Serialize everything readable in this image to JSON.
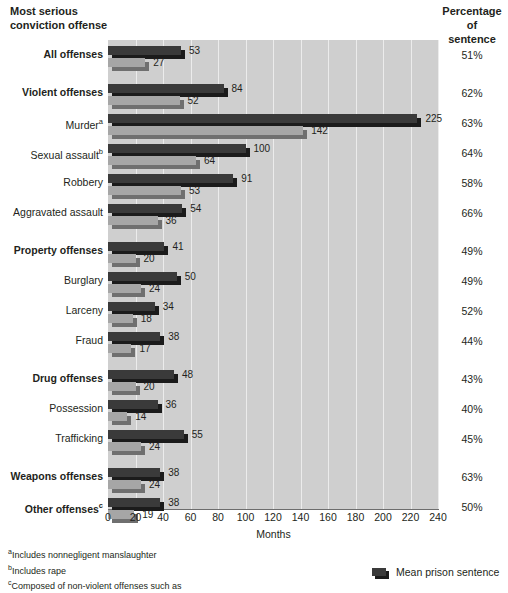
{
  "headers": {
    "left": "Most serious\nconviction offense",
    "right": "Percentage\nof\nsentence"
  },
  "axis": {
    "title": "Months",
    "ticks": [
      "0",
      "20",
      "40",
      "60",
      "80",
      "100",
      "120",
      "140",
      "160",
      "180",
      "200",
      "220",
      "240"
    ]
  },
  "footnotes": [
    {
      "marker": "a",
      "text": "Includes nonnegligent manslaughter"
    },
    {
      "marker": "b",
      "text": "Includes rape"
    },
    {
      "marker": "c",
      "text": "Composed of non-violent offenses such as"
    }
  ],
  "legend": {
    "items": [
      {
        "label": "Mean prison sentence",
        "color": "#3a3a3a"
      }
    ]
  },
  "chart_data": {
    "type": "bar",
    "orientation": "horizontal",
    "title": "",
    "xlabel": "Months",
    "ylabel": "Most serious conviction offense",
    "xlim": [
      0,
      240
    ],
    "xticks": [
      0,
      20,
      40,
      60,
      80,
      100,
      120,
      140,
      160,
      180,
      200,
      220,
      240
    ],
    "grid": true,
    "legend_position": "bottom-right",
    "categories": [
      "All offenses",
      "Violent offenses",
      "Murder",
      "Sexual assault",
      "Robbery",
      "Aggravated assault",
      "Property offenses",
      "Burglary",
      "Larceny",
      "Fraud",
      "Drug offenses",
      "Possession",
      "Trafficking",
      "Weapons offenses",
      "Other offenses"
    ],
    "series": [
      {
        "name": "Mean prison sentence",
        "color": "#3a3a3a",
        "values": [
          53,
          84,
          225,
          100,
          91,
          54,
          41,
          50,
          34,
          38,
          48,
          36,
          55,
          38,
          38
        ]
      },
      {
        "name": "Mean time served",
        "color": "#a6a6a6",
        "values": [
          27,
          52,
          142,
          64,
          53,
          36,
          20,
          24,
          18,
          17,
          20,
          14,
          24,
          24,
          19
        ]
      }
    ],
    "percentage_of_sentence": [
      "51%",
      "62%",
      "63%",
      "64%",
      "58%",
      "66%",
      "49%",
      "49%",
      "52%",
      "44%",
      "43%",
      "40%",
      "45%",
      "63%",
      "50%"
    ]
  },
  "rows": [
    {
      "label": "All offenses",
      "footnote": "",
      "bold": true,
      "sentence": 53,
      "served": 27,
      "pct": "51%",
      "gap_before": 0
    },
    {
      "label": "Violent offenses",
      "footnote": "",
      "bold": true,
      "sentence": 84,
      "served": 52,
      "pct": "62%",
      "gap_before": 1
    },
    {
      "label": "Murder",
      "footnote": "a",
      "bold": false,
      "sentence": 225,
      "served": 142,
      "pct": "63%",
      "gap_before": 0
    },
    {
      "label": "Sexual assault",
      "footnote": "b",
      "bold": false,
      "sentence": 100,
      "served": 64,
      "pct": "64%",
      "gap_before": 0
    },
    {
      "label": "Robbery",
      "footnote": "",
      "bold": false,
      "sentence": 91,
      "served": 53,
      "pct": "58%",
      "gap_before": 0
    },
    {
      "label": "Aggravated assault",
      "footnote": "",
      "bold": false,
      "sentence": 54,
      "served": 36,
      "pct": "66%",
      "gap_before": 0
    },
    {
      "label": "Property offenses",
      "footnote": "",
      "bold": true,
      "sentence": 41,
      "served": 20,
      "pct": "49%",
      "gap_before": 1
    },
    {
      "label": "Burglary",
      "footnote": "",
      "bold": false,
      "sentence": 50,
      "served": 24,
      "pct": "49%",
      "gap_before": 0
    },
    {
      "label": "Larceny",
      "footnote": "",
      "bold": false,
      "sentence": 34,
      "served": 18,
      "pct": "52%",
      "gap_before": 0
    },
    {
      "label": "Fraud",
      "footnote": "",
      "bold": false,
      "sentence": 38,
      "served": 17,
      "pct": "44%",
      "gap_before": 0
    },
    {
      "label": "Drug offenses",
      "footnote": "",
      "bold": true,
      "sentence": 48,
      "served": 20,
      "pct": "43%",
      "gap_before": 1
    },
    {
      "label": "Possession",
      "footnote": "",
      "bold": false,
      "sentence": 36,
      "served": 14,
      "pct": "40%",
      "gap_before": 0
    },
    {
      "label": "Trafficking",
      "footnote": "",
      "bold": false,
      "sentence": 55,
      "served": 24,
      "pct": "45%",
      "gap_before": 0
    },
    {
      "label": "Weapons offenses",
      "footnote": "",
      "bold": true,
      "sentence": 38,
      "served": 24,
      "pct": "63%",
      "gap_before": 1
    },
    {
      "label": "Other offenses",
      "footnote": "c",
      "bold": true,
      "sentence": 38,
      "served": 19,
      "pct": "50%",
      "gap_before": 0
    }
  ]
}
